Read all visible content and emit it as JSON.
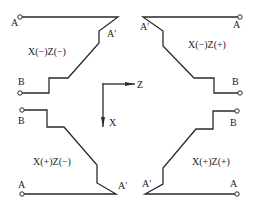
{
  "diagram": {
    "axes": {
      "z_label": "Z",
      "x_label": "X"
    },
    "quadrants": [
      {
        "id": "top-left",
        "label": "X(−)Z(−)",
        "start_label": "A",
        "corner_label": "A′",
        "end_label": "B"
      },
      {
        "id": "top-right",
        "label": "X(−)Z(+)",
        "start_label": "A",
        "corner_label": "A′",
        "end_label": "B"
      },
      {
        "id": "bottom-left",
        "label": "X(+)Z(−)",
        "start_label": "A",
        "corner_label": "A′",
        "end_label": "B"
      },
      {
        "id": "bottom-right",
        "label": "X(+)Z(+)",
        "start_label": "A",
        "corner_label": "A′",
        "end_label": "B"
      }
    ],
    "colors": {
      "line": "#2a2a2a",
      "background": "#ffffff"
    }
  }
}
